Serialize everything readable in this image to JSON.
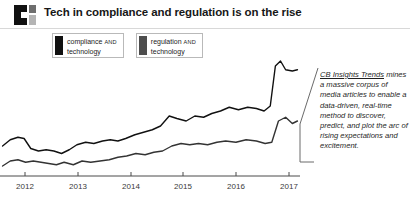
{
  "header": {
    "logo_name": "cb-insights-logo",
    "title": "Tech in compliance and regulation is on the rise"
  },
  "legend": {
    "items": [
      {
        "label_main": "compliance",
        "label_conj": "AND",
        "label_second": "technology",
        "color": "#111111"
      },
      {
        "label_main": "regulation",
        "label_conj": "AND",
        "label_second": "technology",
        "color": "#4d4d4d"
      }
    ]
  },
  "note": {
    "lead": "CB Insights Trends",
    "body": " mines a massive corpus of media articles to enable a data-driven, real-time method to discover, predict, and plot the arc of rising expectations and excitement."
  },
  "chart_data": {
    "type": "line",
    "title": "Tech in compliance and regulation is on the rise",
    "xlabel": "",
    "ylabel": "",
    "grid": false,
    "legend_position": "top-left",
    "categories": [
      "2012",
      "2013",
      "2014",
      "2015",
      "2016",
      "2017"
    ],
    "x_tick_positions": [
      25,
      78,
      131,
      183,
      236,
      289
    ],
    "xlim": [
      2011.75,
      2017.6
    ],
    "ylim": [
      0,
      100
    ],
    "series": [
      {
        "name": "compliance AND technology",
        "color": "#111111",
        "x": [
          2011.8,
          2011.95,
          2012.1,
          2012.22,
          2012.35,
          2012.5,
          2012.65,
          2012.8,
          2012.95,
          2013.1,
          2013.25,
          2013.42,
          2013.58,
          2013.75,
          2013.9,
          2014.05,
          2014.2,
          2014.38,
          2014.55,
          2014.72,
          2014.88,
          2015.05,
          2015.2,
          2015.38,
          2015.55,
          2015.72,
          2015.88,
          2016.05,
          2016.22,
          2016.4,
          2016.58,
          2016.75,
          2016.9,
          2017.02,
          2017.12,
          2017.22,
          2017.32,
          2017.45,
          2017.55
        ],
        "values": [
          24,
          29,
          31,
          30,
          22,
          20,
          21,
          20,
          18,
          21,
          25,
          27,
          26,
          28,
          29,
          28,
          30,
          33,
          35,
          37,
          40,
          48,
          46,
          44,
          48,
          47,
          50,
          52,
          55,
          53,
          55,
          54,
          52,
          56,
          88,
          92,
          85,
          84,
          85
        ]
      },
      {
        "name": "regulation AND technology",
        "color": "#333333",
        "x": [
          2011.8,
          2011.95,
          2012.1,
          2012.25,
          2012.4,
          2012.55,
          2012.7,
          2012.85,
          2013.0,
          2013.18,
          2013.35,
          2013.52,
          2013.7,
          2013.88,
          2014.05,
          2014.22,
          2014.4,
          2014.58,
          2014.75,
          2014.92,
          2015.1,
          2015.28,
          2015.45,
          2015.62,
          2015.8,
          2015.98,
          2016.15,
          2016.35,
          2016.55,
          2016.75,
          2016.92,
          2017.05,
          2017.18,
          2017.32,
          2017.45,
          2017.55
        ],
        "values": [
          8,
          12,
          13,
          11,
          12,
          11,
          10,
          9,
          11,
          9,
          12,
          11,
          12,
          13,
          15,
          16,
          18,
          17,
          19,
          20,
          24,
          26,
          25,
          26,
          25,
          27,
          28,
          27,
          29,
          28,
          26,
          27,
          44,
          47,
          42,
          44
        ]
      }
    ]
  }
}
